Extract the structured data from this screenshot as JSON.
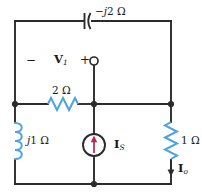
{
  "figure": {
    "name": "ac-circuit-schematic",
    "width": 202,
    "height": 196,
    "background": "#ffffff"
  },
  "colors": {
    "wire": "#2b2b2b",
    "component_blue": "#4da3e0",
    "source_arrow": "#c21f5b",
    "text": "#1a1a1a"
  },
  "components": {
    "capacitor": {
      "label_full": "−j2 Ω",
      "label_sign": "−",
      "label_imag": "j",
      "label_value": "2",
      "label_unit": "Ω",
      "type": "capacitor",
      "orientation": "horizontal",
      "position": "top-branch"
    },
    "resistor_series": {
      "label_value": "2",
      "label_unit": "Ω",
      "label_full": "2 Ω",
      "type": "resistor",
      "orientation": "horizontal",
      "position": "middle-left-branch"
    },
    "inductor": {
      "label_imag": "j",
      "label_value": "1",
      "label_unit": "Ω",
      "label_full": "j1 Ω",
      "type": "inductor",
      "orientation": "vertical",
      "position": "left-branch"
    },
    "resistor_load": {
      "label_value": "1",
      "label_unit": "Ω",
      "label_full": "1 Ω",
      "type": "resistor",
      "orientation": "vertical",
      "position": "right-branch"
    },
    "current_source": {
      "label_symbol": "I",
      "label_subscript": "S",
      "label_full": "I_S",
      "type": "independent-current-source",
      "arrow_direction": "up",
      "position": "center-branch"
    }
  },
  "annotations": {
    "voltage_v1": {
      "symbol": "V",
      "subscript": "1",
      "full": "V₁"
    },
    "polarity_minus": "−",
    "polarity_plus": "+",
    "terminal": "open-terminal-node",
    "current_io": {
      "symbol": "I",
      "subscript": "o",
      "full": "Iₒ"
    }
  },
  "nodes": [
    {
      "name": "node-left-middle",
      "x": 15,
      "y": 104
    },
    {
      "name": "node-center-middle",
      "x": 94,
      "y": 104
    },
    {
      "name": "node-right-middle",
      "x": 171,
      "y": 104
    },
    {
      "name": "node-bottom-center",
      "x": 94,
      "y": 184
    }
  ]
}
